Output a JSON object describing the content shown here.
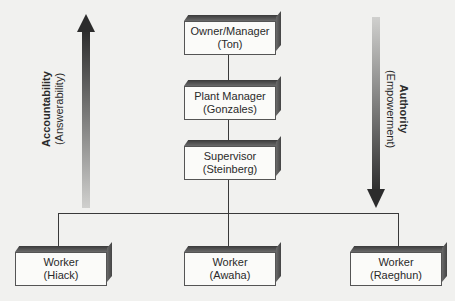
{
  "diagram": {
    "type": "organizational-hierarchy",
    "nodes": [
      {
        "id": "owner",
        "role": "Owner/Manager",
        "name": "(Ton)"
      },
      {
        "id": "plant_manager",
        "role": "Plant Manager",
        "name": "(Gonzales)"
      },
      {
        "id": "supervisor",
        "role": "Supervisor",
        "name": "(Steinberg)"
      },
      {
        "id": "worker_hiack",
        "role": "Worker",
        "name": "(Hiack)"
      },
      {
        "id": "worker_awaha",
        "role": "Worker",
        "name": "(Awaha)"
      },
      {
        "id": "worker_raeghun",
        "role": "Worker",
        "name": "(Raeghun)"
      }
    ],
    "edges": [
      [
        "owner",
        "plant_manager"
      ],
      [
        "plant_manager",
        "supervisor"
      ],
      [
        "supervisor",
        "worker_hiack"
      ],
      [
        "supervisor",
        "worker_awaha"
      ],
      [
        "supervisor",
        "worker_raeghun"
      ]
    ],
    "arrows": {
      "left": {
        "direction": "up",
        "title": "Accountability",
        "subtitle": "(Answerability)"
      },
      "right": {
        "direction": "down",
        "title": "Authority",
        "subtitle": "(Empowerment)"
      }
    }
  }
}
